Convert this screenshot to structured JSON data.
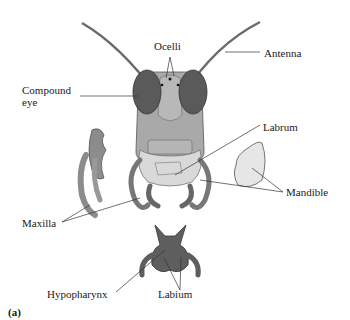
{
  "figure": {
    "panel_label": "(a)",
    "colors": {
      "head": "#a9a9a9",
      "eye": "#5a5a5a",
      "labrum": "#d9d9d9",
      "mandible": "#e6e6e6",
      "labium": "#5e5e5e",
      "maxilla": "#8c8c8c",
      "leader_line": "#333333"
    }
  },
  "labels": {
    "ocelli": "Ocelli",
    "antenna": "Antenna",
    "compound_eye_line1": "Compound",
    "compound_eye_line2": "eye",
    "labrum": "Labrum",
    "mandible": "Mandible",
    "maxilla": "Maxilla",
    "hypopharynx": "Hypopharynx",
    "labium": "Labium"
  }
}
